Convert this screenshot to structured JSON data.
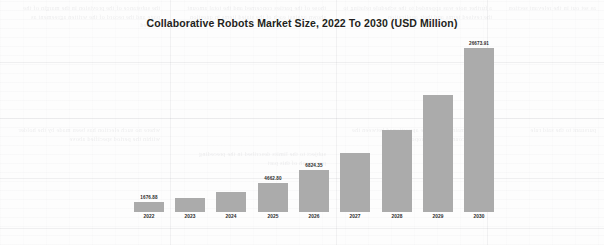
{
  "chart_data": {
    "type": "bar",
    "title": "Collaborative Robots Market Size, 2022 To 2030 (USD Million)",
    "xlabel": "",
    "ylabel": "",
    "categories": [
      "2022",
      "2023",
      "2024",
      "2025",
      "2026",
      "2027",
      "2028",
      "2029",
      "2030"
    ],
    "values": [
      1676.88,
      2350.0,
      3280.0,
      4662.8,
      6824.35,
      9650.0,
      13400.0,
      19000.0,
      26673.91
    ],
    "point_labels": [
      "1676.88",
      "",
      "",
      "4662.80",
      "6824.35",
      "",
      "",
      "",
      "26673.91"
    ],
    "ylim": [
      0,
      28000
    ],
    "grid": false,
    "legend": false,
    "series_color": "#ababab",
    "background_color": "#fdfdfd",
    "title_color": "#231f20"
  },
  "background_text": {
    "col_a": "the substance of the provision in the margin of the page and the record of the written agreement as entered",
    "col_b": "those of the parties concerned and the total amount shown against each of the stated items in question",
    "col_c": "a further note was appended to the schedule relating to the revised terms and their application",
    "col_d": "as set out in the relevant section",
    "col_e": "where no such election has been made by the holder within the period specified above",
    "col_f": "subject to the limits described in the preceding paragraph of this part",
    "col_g": "and the remainder shall be apportioned between the several accounts in due proportion",
    "col_h": "pursuant to the said rule"
  }
}
